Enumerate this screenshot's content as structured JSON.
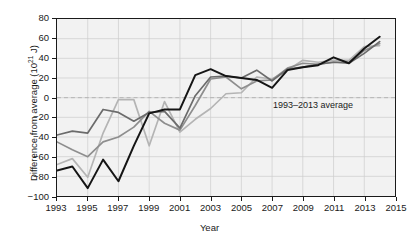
{
  "chart_data": {
    "type": "line",
    "title": "",
    "subtitle": "",
    "xlabel": "Year",
    "ylabel": "Difference from average (10^21 J)",
    "ylabel_prefix": "Difference from average (10",
    "ylabel_exponent": "21",
    "ylabel_suffix": " J)",
    "xlim": [
      1993,
      2015
    ],
    "ylim": [
      -100,
      80
    ],
    "xticks": [
      1993,
      1995,
      1997,
      1999,
      2001,
      2003,
      2005,
      2007,
      2009,
      2011,
      2013,
      2015
    ],
    "yticks": [
      -100,
      -80,
      -60,
      -40,
      -20,
      0,
      20,
      40,
      60,
      80
    ],
    "grid": true,
    "grid_color": "#cccccc",
    "plot_background": "#f2f2f2",
    "zero_line": {
      "value": 0,
      "style": "dashed",
      "color": "#b0b0b0"
    },
    "legend": "none",
    "annotations": [
      {
        "text": "1993–2013 average",
        "x": 2008.2,
        "y": -6
      }
    ],
    "x": [
      1993,
      1994,
      1995,
      1996,
      1997,
      1998,
      1999,
      2000,
      2001,
      2002,
      2003,
      2004,
      2005,
      2006,
      2007,
      2008,
      2009,
      2010,
      2011,
      2012,
      2013,
      2014
    ],
    "series": [
      {
        "name": "series-black",
        "color": "#151515",
        "values": [
          -74,
          -70,
          -92,
          -63,
          -85,
          -49,
          -16,
          -12,
          -12,
          23,
          29,
          22,
          20,
          18,
          10,
          28,
          31,
          33,
          41,
          35,
          50,
          62
        ]
      },
      {
        "name": "series-dark-gray",
        "color": "#6b6b6b",
        "values": [
          -38,
          -34,
          -36,
          -12,
          -15,
          -24,
          -15,
          -14,
          -31,
          2,
          21,
          22,
          20,
          28,
          17,
          29,
          31,
          34,
          36,
          35,
          45,
          57
        ]
      },
      {
        "name": "series-medium-gray",
        "color": "#8e8e8e",
        "values": [
          -45,
          -53,
          -60,
          -45,
          -40,
          -30,
          -14,
          -26,
          -33,
          -8,
          19,
          21,
          9,
          17,
          18,
          30,
          35,
          34,
          36,
          36,
          48,
          55
        ]
      },
      {
        "name": "series-light-gray",
        "color": "#b4b4b4",
        "values": [
          -68,
          -62,
          -81,
          -36,
          -2,
          -2,
          -49,
          -4,
          -35,
          -22,
          -11,
          4,
          5,
          21,
          19,
          28,
          38,
          36,
          38,
          38,
          52,
          53
        ]
      }
    ]
  }
}
